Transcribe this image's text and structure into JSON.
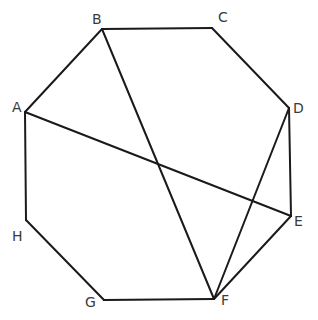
{
  "diagram": {
    "type": "octagon-with-diagonals",
    "colors": {
      "stroke": "#1a1a1a",
      "label": "#3a3a3a",
      "background": "#ffffff"
    },
    "vertices": [
      {
        "id": "A",
        "x": 25,
        "y": 112,
        "label": "A",
        "lx": 12,
        "ly": 112
      },
      {
        "id": "B",
        "x": 102,
        "y": 29,
        "label": "B",
        "lx": 92,
        "ly": 24
      },
      {
        "id": "C",
        "x": 212,
        "y": 28,
        "label": "C",
        "lx": 218,
        "ly": 22
      },
      {
        "id": "D",
        "x": 289,
        "y": 108,
        "label": "D",
        "lx": 293,
        "ly": 113
      },
      {
        "id": "E",
        "x": 291,
        "y": 216,
        "label": "E",
        "lx": 294,
        "ly": 226
      },
      {
        "id": "F",
        "x": 214,
        "y": 299,
        "label": "F",
        "lx": 221,
        "ly": 305
      },
      {
        "id": "G",
        "x": 104,
        "y": 300,
        "label": "G",
        "lx": 85,
        "ly": 307
      },
      {
        "id": "H",
        "x": 26,
        "y": 220,
        "label": "H",
        "lx": 12,
        "ly": 241
      }
    ],
    "sides": [
      [
        "A",
        "B"
      ],
      [
        "B",
        "C"
      ],
      [
        "C",
        "D"
      ],
      [
        "D",
        "E"
      ],
      [
        "E",
        "F"
      ],
      [
        "F",
        "G"
      ],
      [
        "G",
        "H"
      ],
      [
        "H",
        "A"
      ]
    ],
    "diagonals": [
      [
        "A",
        "E"
      ],
      [
        "B",
        "F"
      ],
      [
        "D",
        "F"
      ]
    ]
  }
}
